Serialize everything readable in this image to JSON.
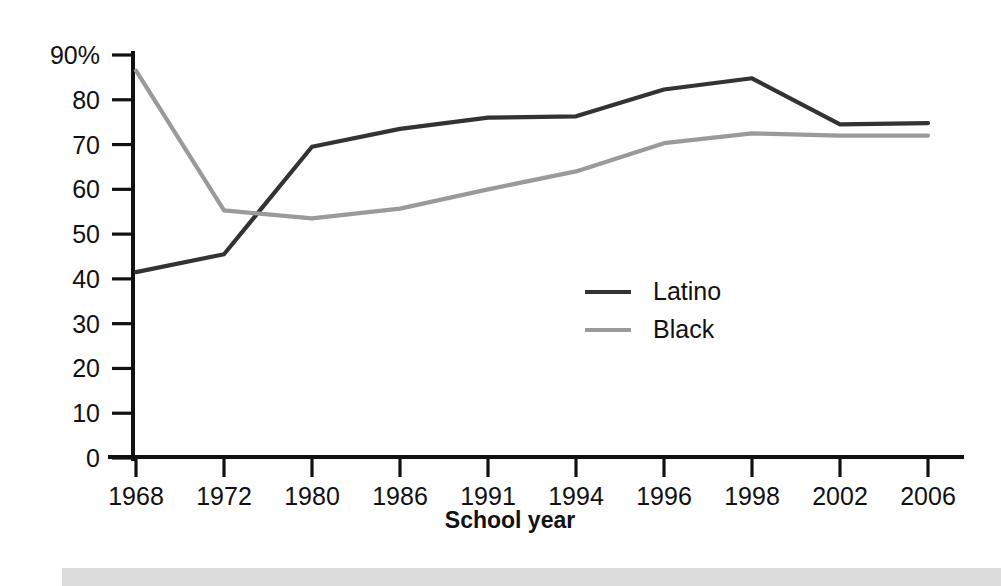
{
  "chart_data": {
    "type": "line",
    "title": "",
    "xlabel": "School year",
    "ylabel": "",
    "categories": [
      "1968",
      "1972",
      "1980",
      "1986",
      "1991",
      "1994",
      "1996",
      "1998",
      "2002",
      "2006"
    ],
    "series": [
      {
        "name": "Latino",
        "color": "#333333",
        "values": [
          41.5,
          45.5,
          69.5,
          73.5,
          76.0,
          76.3,
          82.3,
          84.8,
          74.5,
          74.8
        ]
      },
      {
        "name": "Black",
        "color": "#9a9a9a",
        "values": [
          86.5,
          55.3,
          53.5,
          55.7,
          60.0,
          64.0,
          70.3,
          72.5,
          72.0,
          72.0
        ]
      }
    ],
    "ylim": [
      0,
      90
    ],
    "ytick_labels": [
      "90%",
      "80",
      "70",
      "60",
      "50",
      "40",
      "30",
      "20",
      "10",
      "0"
    ],
    "ytick_values": [
      90,
      80,
      70,
      60,
      50,
      40,
      30,
      20,
      10,
      0
    ],
    "grid": false,
    "legend_position": "center-right"
  },
  "legend": {
    "entries": [
      {
        "label": "Latino"
      },
      {
        "label": "Black"
      }
    ]
  },
  "axes": {
    "x_title": "School year"
  },
  "colors": {
    "latino_line": "#333333",
    "black_line": "#9a9a9a",
    "axis": "#111111",
    "footer_bar": "#dcdcdc",
    "background": "#ffffff"
  }
}
